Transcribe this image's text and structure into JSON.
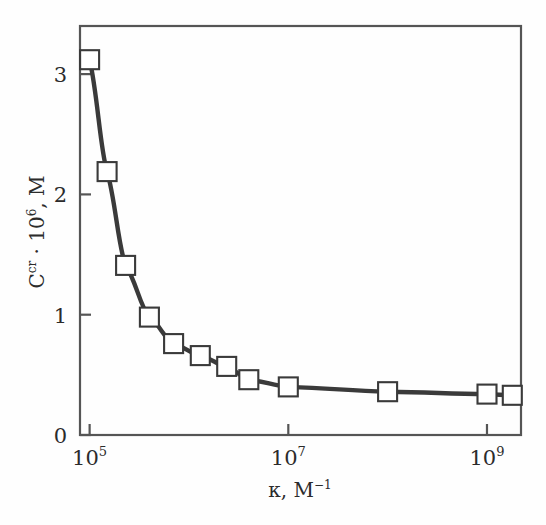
{
  "figure": {
    "background_color": "#fefefe",
    "line_color": "#3a3a3a",
    "marker_fill": "#ffffff",
    "marker_edge": "#3a3a3a",
    "axis_color": "#555555"
  },
  "axes": {
    "x": {
      "title_base": "κ, M",
      "title_exponent": "−1",
      "tick_mantissa": "10",
      "ticks": [
        {
          "label_base": "10",
          "label_exp": "5",
          "value": 100000
        },
        {
          "label_base": "10",
          "label_exp": "7",
          "value": 10000000
        },
        {
          "label_base": "10",
          "label_exp": "9",
          "value": 1000000000
        }
      ]
    },
    "y": {
      "title_base": "C",
      "title_sup": "cr",
      "title_mid": " · 10",
      "title_exp": "6",
      "title_tail": ", M",
      "ticks": [
        "0",
        "1",
        "2",
        "3"
      ]
    }
  },
  "chart_data": {
    "type": "line",
    "title": "",
    "xlabel": "κ, M⁻¹",
    "ylabel": "Cᶜʳ · 10⁶, M",
    "xscale": "log",
    "yscale": "linear",
    "xlim": [
      80000,
      2200000000
    ],
    "ylim": [
      0,
      3.4
    ],
    "grid": false,
    "legend": "none",
    "marker": "open-square",
    "x": [
      100000,
      150000,
      230000,
      400000,
      700000,
      1300000,
      2400000,
      4000000,
      10000000,
      100000000,
      1000000000,
      1800000000
    ],
    "values": [
      3.12,
      2.19,
      1.41,
      0.98,
      0.76,
      0.66,
      0.57,
      0.46,
      0.4,
      0.36,
      0.34,
      0.33
    ],
    "series": [
      {
        "name": "critical concentration",
        "values": [
          3.12,
          2.19,
          1.41,
          0.98,
          0.76,
          0.66,
          0.57,
          0.46,
          0.4,
          0.36,
          0.34,
          0.33
        ]
      }
    ],
    "xtick_values": [
      100000,
      10000000,
      1000000000
    ],
    "xtick_labels": [
      "10⁵",
      "10⁷",
      "10⁹"
    ],
    "ytick_values": [
      0,
      1,
      2,
      3
    ],
    "ytick_labels": [
      "0",
      "1",
      "2",
      "3"
    ]
  }
}
